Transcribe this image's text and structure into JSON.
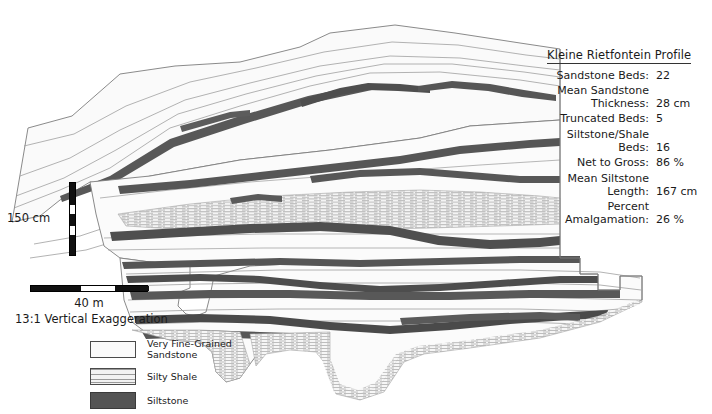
{
  "figure": {
    "kind": "stratigraphic-cross-section"
  },
  "stats": {
    "title": "Kleine Rietfontein Profile",
    "rows": [
      {
        "label": "Sandstone Beds:",
        "value": "22"
      },
      {
        "label": "Mean Sandstone Thickness:",
        "value": "28 cm"
      },
      {
        "label": "Truncated Beds:",
        "value": "5"
      },
      {
        "label": "Siltstone/Shale Beds:",
        "value": "16"
      },
      {
        "label": "Net to Gross:",
        "value": "86 %"
      },
      {
        "label": "Mean Siltstone Length:",
        "value": "167 cm"
      },
      {
        "label": "Percent Amalgamation:",
        "value": "26 %"
      }
    ]
  },
  "vertical_scale": {
    "label": "150 cm"
  },
  "horizontal_scale": {
    "label": "40 m",
    "exaggeration": "13:1 Vertical Exaggeration"
  },
  "legend": {
    "items": [
      {
        "key": "sand",
        "label": "Very Fine-Grained\nSandstone"
      },
      {
        "key": "shale",
        "label": "Silty Shale"
      },
      {
        "key": "silt",
        "label": "Siltstone"
      }
    ]
  },
  "colors": {
    "sandstone": "#fafafa",
    "sandstone_stroke": "#808080",
    "shale_line": "#9a9a9a",
    "siltstone": "#545454",
    "background": "#ffffff"
  }
}
